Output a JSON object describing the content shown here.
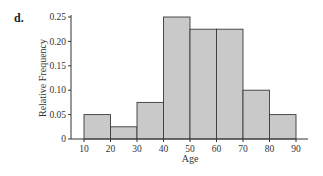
{
  "panel_label": "d.",
  "chart_data": {
    "type": "bar",
    "subtype": "histogram",
    "title": "",
    "xlabel": "Age",
    "ylabel": "Relative Frequency",
    "bins": [
      [
        10,
        20
      ],
      [
        20,
        30
      ],
      [
        30,
        40
      ],
      [
        40,
        50
      ],
      [
        50,
        60
      ],
      [
        60,
        70
      ],
      [
        70,
        80
      ],
      [
        80,
        90
      ]
    ],
    "categories": [
      "10-20",
      "20-30",
      "30-40",
      "40-50",
      "50-60",
      "60-70",
      "70-80",
      "80-90"
    ],
    "values": [
      0.05,
      0.025,
      0.075,
      0.25,
      0.225,
      0.225,
      0.1,
      0.05
    ],
    "xticks": [
      "10",
      "20",
      "30",
      "40",
      "50",
      "60",
      "70",
      "80",
      "90"
    ],
    "yticks": [
      "0",
      "0.05",
      "0.10",
      "0.15",
      "0.20",
      "0.25"
    ],
    "xlim": [
      10,
      90
    ],
    "ylim": [
      0,
      0.25
    ],
    "grid": false,
    "legend": null,
    "colors": {
      "bar_fill": "#c9c9c9",
      "bar_stroke": "#3a3a3a",
      "axis": "#333333"
    }
  }
}
